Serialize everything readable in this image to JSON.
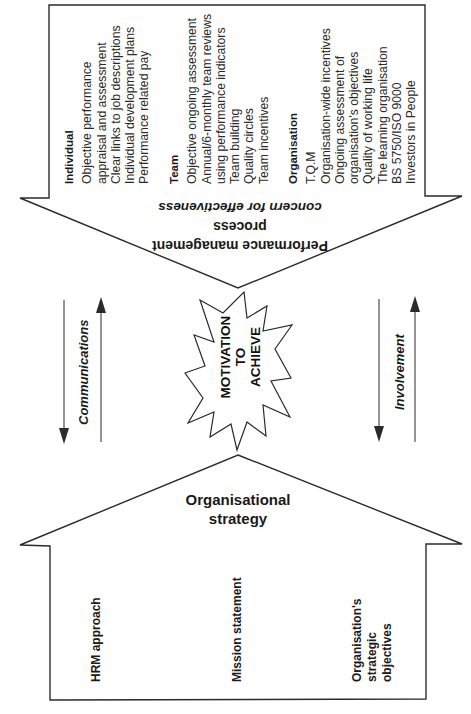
{
  "performance_arrow": {
    "title_line1": "Performance management",
    "title_line2": "process",
    "subtitle": "concern for effectiveness",
    "columns": [
      {
        "heading": "Individual",
        "items": [
          "Objective performance",
          "appraisal and assessment",
          "Clear links to job descriptions",
          "Individual development plans",
          "Performance related pay"
        ]
      },
      {
        "heading": "Team",
        "items": [
          "Objective ongoing assessment",
          "Annual/6-monthly team reviews",
          "using performance indicators",
          "Team building",
          "Quality circles",
          "Team incentives"
        ]
      },
      {
        "heading": "Organisation",
        "items": [
          "T.Q.M",
          "Organisation-wide incentives",
          "Ongoing assessment of",
          "organisation's objectives",
          "Quality of working life",
          "The learning organisation",
          "BS 5750/ISO 9000",
          "Investors in People"
        ]
      }
    ]
  },
  "center": {
    "line1": "MOTIVATION",
    "line2": "TO",
    "line3": "ACHIEVE"
  },
  "side_labels": {
    "left": "Communications",
    "right": "Involvement"
  },
  "strategy_house": {
    "title_line1": "Organisational",
    "title_line2": "strategy",
    "pillars": [
      {
        "lines": [
          "HRM approach"
        ]
      },
      {
        "lines": [
          "Mission statement"
        ]
      },
      {
        "lines": [
          "Organisation's",
          "strategic",
          "objectives"
        ]
      }
    ]
  },
  "colors": {
    "line": "#2b2b2b",
    "text": "#1a1a1a",
    "background": "#ffffff"
  }
}
